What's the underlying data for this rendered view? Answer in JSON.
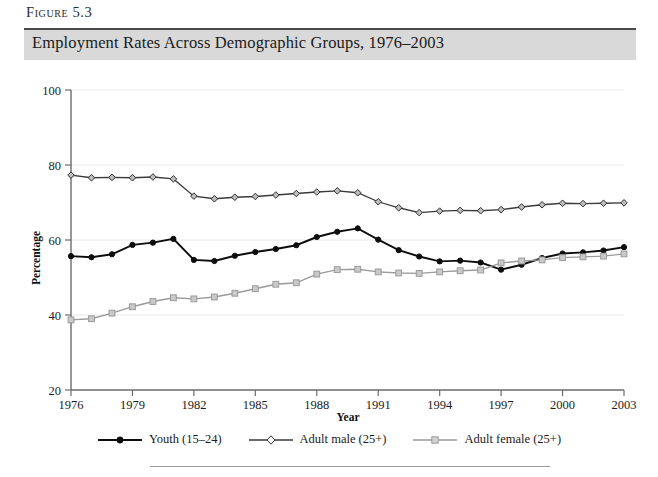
{
  "figure": {
    "label": "Figure 5.3",
    "title": "Employment Rates Across Demographic Groups, 1976–2003"
  },
  "legend": {
    "items": [
      {
        "label": "Youth (15–24)",
        "marker": "filled-circle-marker",
        "color": "#0d0d0d"
      },
      {
        "label": "Adult male (25+)",
        "marker": "open-diamond-marker",
        "color": "#3a3a3a"
      },
      {
        "label": "Adult female (25+)",
        "marker": "open-square-marker",
        "color": "#9a9a9a"
      }
    ]
  },
  "chart_data": {
    "type": "line",
    "title": "Employment Rates Across Demographic Groups, 1976–2003",
    "xlabel": "Year",
    "ylabel": "Percentage",
    "xlim": [
      1976,
      2003
    ],
    "ylim": [
      20,
      100
    ],
    "ytick_labels": [
      "20",
      "40",
      "60",
      "80",
      "100"
    ],
    "yticks": [
      20,
      40,
      60,
      80,
      100
    ],
    "xtick_labels": [
      "1976",
      "1979",
      "1982",
      "1985",
      "1988",
      "1991",
      "1994",
      "1997",
      "2000",
      "2003"
    ],
    "xticks": [
      1976,
      1979,
      1982,
      1985,
      1988,
      1991,
      1994,
      1997,
      2000,
      2003
    ],
    "grid": "horizontal",
    "legend_position": "bottom",
    "x": [
      1976,
      1977,
      1978,
      1979,
      1980,
      1981,
      1982,
      1983,
      1984,
      1985,
      1986,
      1987,
      1988,
      1989,
      1990,
      1991,
      1992,
      1993,
      1994,
      1995,
      1996,
      1997,
      1998,
      1999,
      2000,
      2001,
      2002,
      2003
    ],
    "series": [
      {
        "name": "Youth (15–24)",
        "color": "#0d0d0d",
        "marker": "filled-circle-marker",
        "values": [
          55.7,
          55.4,
          56.2,
          58.7,
          59.3,
          60.3,
          54.7,
          54.4,
          55.8,
          56.8,
          57.6,
          58.6,
          60.8,
          62.2,
          63.1,
          60.1,
          57.3,
          55.6,
          54.3,
          54.5,
          54.0,
          52.1,
          53.4,
          55.2,
          56.4,
          56.7,
          57.2,
          58.1
        ]
      },
      {
        "name": "Adult male (25+)",
        "color": "#3a3a3a",
        "marker": "open-diamond-marker",
        "values": [
          77.3,
          76.6,
          76.7,
          76.6,
          76.8,
          76.3,
          71.7,
          71.0,
          71.4,
          71.6,
          72.0,
          72.4,
          72.8,
          73.1,
          72.6,
          70.2,
          68.6,
          67.3,
          67.7,
          67.9,
          67.8,
          68.1,
          68.8,
          69.4,
          69.8,
          69.7,
          69.8,
          69.9
        ]
      },
      {
        "name": "Adult female (25+)",
        "color": "#9a9a9a",
        "marker": "open-square-marker",
        "values": [
          38.7,
          39.0,
          40.5,
          42.2,
          43.6,
          44.6,
          44.3,
          44.8,
          45.8,
          47.0,
          48.2,
          48.6,
          50.9,
          52.1,
          52.2,
          51.5,
          51.2,
          51.1,
          51.5,
          51.8,
          52.0,
          53.9,
          54.4,
          54.7,
          55.3,
          55.5,
          55.7,
          56.3
        ]
      }
    ]
  }
}
